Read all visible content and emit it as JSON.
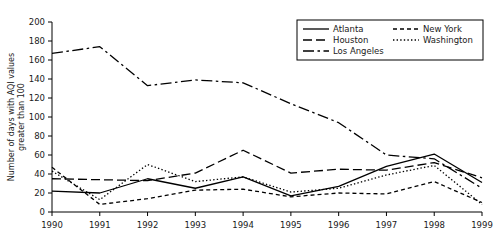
{
  "chart_data": {
    "type": "line",
    "title": "",
    "xlabel": "",
    "ylabel": "Number of days with AQI values greater than 100",
    "ylabel_line1": "Number of days with AQI values",
    "ylabel_line2": "greater than 100",
    "x": [
      1990,
      1991,
      1992,
      1993,
      1994,
      1995,
      1996,
      1997,
      1998,
      1999
    ],
    "xticklabels": [
      "1990",
      "1991",
      "1992",
      "1993",
      "1994",
      "1995",
      "1996",
      "1997",
      "1998",
      "1999"
    ],
    "yticks": [
      0,
      20,
      40,
      60,
      80,
      100,
      120,
      140,
      160,
      180,
      200
    ],
    "yticklabels": [
      "0",
      "20",
      "40",
      "60",
      "80",
      "100",
      "120",
      "140",
      "160",
      "180",
      "200"
    ],
    "ylim": [
      0,
      200
    ],
    "xlim": [
      1990,
      1999
    ],
    "grid": false,
    "legend_position": "top-right",
    "series": [
      {
        "name": "Atlanta",
        "dash": "solid",
        "color": "#000000",
        "values": [
          22,
          20,
          35,
          25,
          37,
          17,
          27,
          48,
          61,
          31
        ]
      },
      {
        "name": "Houston",
        "dash": "dashed",
        "color": "#000000",
        "values": [
          35,
          34,
          33,
          41,
          65,
          41,
          45,
          44,
          52,
          36
        ]
      },
      {
        "name": "Los Angeles",
        "dash": "dashdot",
        "color": "#000000",
        "values": [
          167,
          174,
          133,
          139,
          136,
          114,
          94,
          60,
          56,
          25
        ]
      },
      {
        "name": "New York",
        "dash": "dashed-short",
        "color": "#000000",
        "values": [
          47,
          8,
          14,
          23,
          24,
          16,
          20,
          19,
          32,
          10
        ]
      },
      {
        "name": "Washington",
        "dash": "dotted",
        "color": "#000000",
        "values": [
          43,
          13,
          50,
          32,
          37,
          21,
          25,
          39,
          49,
          8
        ]
      }
    ]
  },
  "legend": {
    "items": [
      {
        "label": "Atlanta"
      },
      {
        "label": "Houston"
      },
      {
        "label": "Los Angeles"
      },
      {
        "label": "New York"
      },
      {
        "label": "Washington"
      }
    ]
  }
}
